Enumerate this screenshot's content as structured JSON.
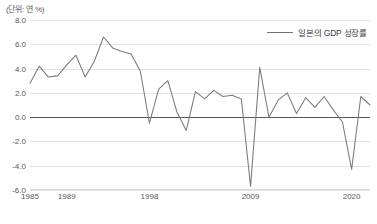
{
  "unit_label": "(단위: 연 %)",
  "legend": {
    "series_label": "일본의 GDP 성장률",
    "line_color": "#7a7a7c"
  },
  "colors": {
    "grid": "#e3e3e5",
    "zero_axis": "#58595b",
    "text": "#58595b",
    "series": "#7a7a7c"
  },
  "chart_data": {
    "type": "line",
    "title": "",
    "subtitle": "",
    "xlabel": "",
    "ylabel": "(단위: 연 %)",
    "grid": true,
    "legend_position": "top-right",
    "ylim": [
      -6.0,
      8.0
    ],
    "xlim": [
      1985,
      2022
    ],
    "ytick_labels": [
      "8.0",
      "6.0",
      "4.0",
      "2.0",
      "0.0",
      "-2.0",
      "-4.0",
      "-6.0"
    ],
    "ytick_values": [
      8.0,
      6.0,
      4.0,
      2.0,
      0.0,
      -2.0,
      -4.0,
      -6.0
    ],
    "xtick_labels": [
      "1985",
      "1989",
      "1998",
      "2009",
      "2020"
    ],
    "xtick_values": [
      1985,
      1989,
      1998,
      2009,
      2020
    ],
    "series": [
      {
        "name": "일본의 GDP 성장률",
        "color": "#7a7a7c",
        "x": [
          1985,
          1986,
          1987,
          1988,
          1989,
          1990,
          1991,
          1992,
          1993,
          1994,
          1995,
          1996,
          1997,
          1998,
          1999,
          2000,
          2001,
          2002,
          2003,
          2004,
          2005,
          2006,
          2007,
          2008,
          2009,
          2010,
          2011,
          2012,
          2013,
          2014,
          2015,
          2016,
          2017,
          2018,
          2019,
          2020,
          2021,
          2022
        ],
        "values": [
          2.8,
          4.2,
          3.3,
          3.4,
          4.3,
          5.1,
          3.3,
          4.6,
          6.6,
          5.7,
          5.4,
          5.2,
          3.8,
          -0.5,
          2.3,
          3.0,
          0.4,
          -1.1,
          2.1,
          1.5,
          2.2,
          1.7,
          1.8,
          1.5,
          -5.7,
          4.1,
          0.0,
          1.4,
          2.0,
          0.3,
          1.6,
          0.8,
          1.7,
          0.6,
          -0.4,
          -4.3,
          1.7,
          1.0
        ]
      }
    ]
  }
}
